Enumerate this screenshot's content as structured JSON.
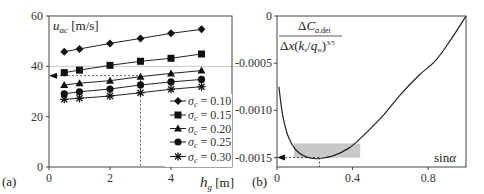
{
  "chart_data": [
    {
      "panel": "(a)",
      "type": "line",
      "xlabel": "h_g [m]",
      "ylabel": "u_ac [m/s]",
      "xlim": [
        0,
        6
      ],
      "ylim": [
        0,
        60
      ],
      "xticks": [
        0,
        2,
        4
      ],
      "yticks": [
        0,
        20,
        40,
        60
      ],
      "grid_y": [
        40
      ],
      "x": [
        0.5,
        1,
        2,
        3,
        4,
        5
      ],
      "series": [
        {
          "name": "σc = 0.10",
          "marker": "diamond",
          "values": [
            45.8,
            46.9,
            49.1,
            51.1,
            53.1,
            54.7
          ]
        },
        {
          "name": "σc = 0.15",
          "marker": "square",
          "values": [
            37.5,
            38.5,
            40.4,
            42.0,
            43.2,
            44.9
          ]
        },
        {
          "name": "σc = 0.20",
          "marker": "triangle",
          "values": [
            32.6,
            33.3,
            34.3,
            35.9,
            37.2,
            38.3
          ]
        },
        {
          "name": "σc = 0.25",
          "marker": "circle",
          "values": [
            29.1,
            29.9,
            31.0,
            32.6,
            33.8,
            34.8
          ]
        },
        {
          "name": "σc = 0.30",
          "marker": "asterisk",
          "values": [
            26.9,
            27.3,
            28.2,
            29.5,
            30.9,
            31.9
          ]
        }
      ],
      "annotations": {
        "dashed_x": 3,
        "dashed_y": 36.3,
        "arrow": "left"
      },
      "legend_position": "lower right",
      "legend": [
        "σc = 0.10",
        "σc = 0.15",
        "σc = 0.20",
        "σc = 0.25",
        "σc = 0.30"
      ]
    },
    {
      "panel": "(b)",
      "type": "line",
      "xlabel": "sinα",
      "ylabel": "ΔC_a,dei / (Δx (k_s/q_w)^3/5)",
      "xlim": [
        0,
        1
      ],
      "ylim": [
        -0.0016,
        0
      ],
      "xticks": [
        0,
        0.4,
        0.8
      ],
      "yticks": [
        0,
        -0.0005,
        -0.001,
        -0.0015
      ],
      "x": [
        0.01,
        0.03,
        0.06,
        0.1,
        0.15,
        0.2,
        0.225,
        0.3,
        0.38,
        0.44,
        0.55,
        0.65,
        0.75,
        0.84,
        0.92,
        1.0
      ],
      "values": [
        -0.00075,
        -0.00105,
        -0.00128,
        -0.00142,
        -0.00149,
        -0.00151,
        -0.00151,
        -0.00148,
        -0.0014,
        -0.0013,
        -0.00108,
        -0.00084,
        -0.00063,
        -0.00047,
        -0.00025,
        0.0
      ],
      "annotations": {
        "min_x": 0.225,
        "min_y": -0.0015,
        "shaded_x": [
          0.09,
          0.44
        ],
        "shaded_y": [
          -0.0015,
          -0.00135
        ],
        "arrow": "left"
      }
    }
  ],
  "labels": {
    "a_panel": "(a)",
    "b_panel": "(b)",
    "a_y_unit": "[m/s]",
    "a_x_unit": "[m]",
    "b_x": "sinα",
    "b_den": "Δx(k",
    "b_num": "ΔC"
  }
}
